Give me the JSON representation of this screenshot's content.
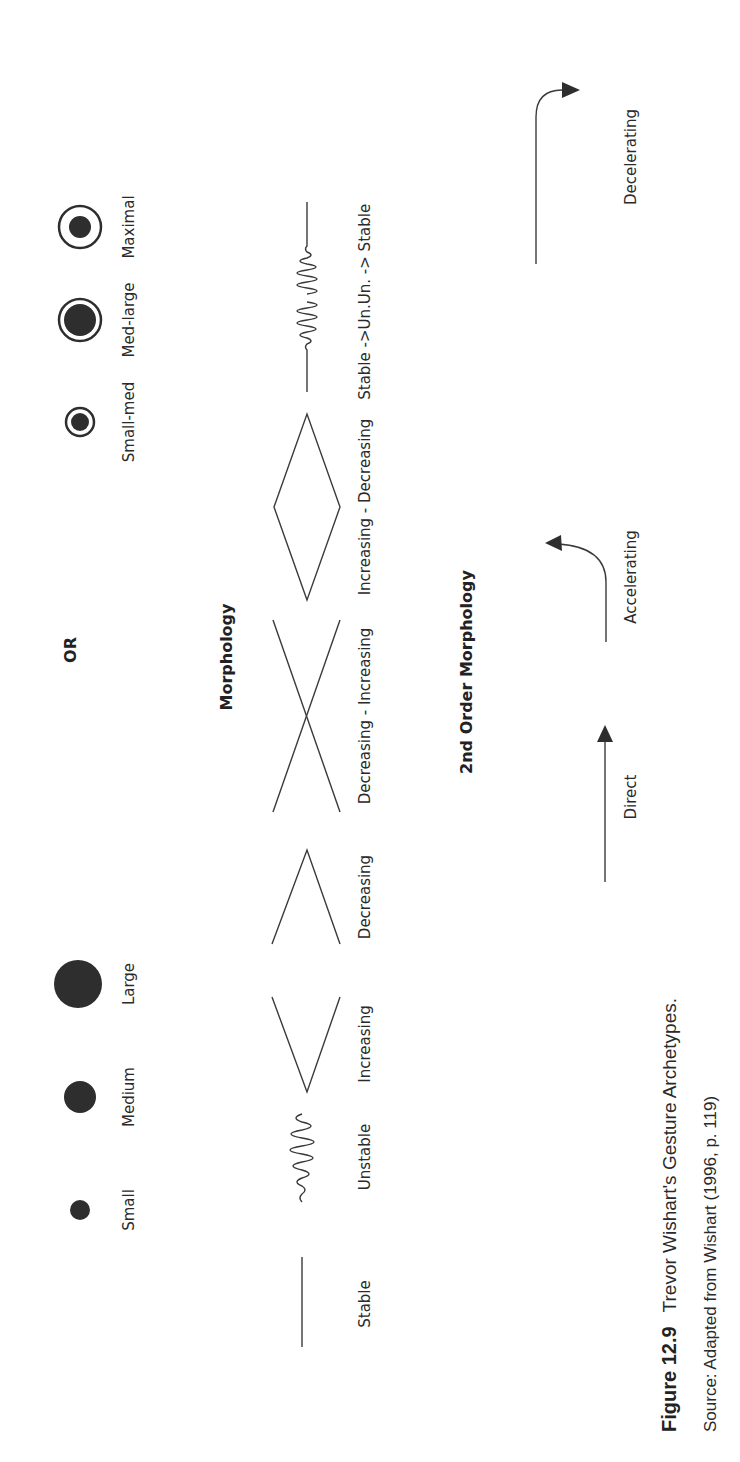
{
  "figure": {
    "orientation": "rotated-90-ccw",
    "sizes": {
      "items": [
        {
          "label": "Small",
          "type": "dot",
          "radius": 10
        },
        {
          "label": "Medium",
          "type": "dot",
          "radius": 16
        },
        {
          "label": "Large",
          "type": "dot",
          "radius": 24
        }
      ],
      "separator": "OR",
      "ring_items": [
        {
          "label": "Small-med",
          "type": "ring-dot"
        },
        {
          "label": "Med-large",
          "type": "ring-dot"
        },
        {
          "label": "Maximal",
          "type": "ring-dot"
        }
      ]
    },
    "morphology": {
      "title": "Morphology",
      "items": [
        {
          "label": "Stable",
          "shape": "line"
        },
        {
          "label": "Unstable",
          "shape": "wave"
        },
        {
          "label": "Increasing",
          "shape": "opening-wedge"
        },
        {
          "label": "Decreasing",
          "shape": "closing-wedge"
        },
        {
          "label": "Decreasing - Increasing",
          "shape": "cross"
        },
        {
          "label": "Increasing - Decreasing",
          "shape": "diamond"
        },
        {
          "label": "Stable ->Un.",
          "shape": "line-to-wave"
        },
        {
          "label": "Un. -> Stable",
          "shape": "wave-to-line"
        }
      ]
    },
    "second_order": {
      "title": "2nd Order Morphology",
      "items": [
        {
          "label": "Direct",
          "shape": "straight-arrow"
        },
        {
          "label": "Accelerating",
          "shape": "curve-up-arrow"
        },
        {
          "label": "Decelerating",
          "shape": "curve-right-arrow"
        }
      ]
    },
    "caption": {
      "number": "Figure 12.9",
      "text": "Trevor Wishart's Gesture Archetypes.",
      "source": "Source: Adapted from Wishart (1996, p. 119)"
    }
  }
}
